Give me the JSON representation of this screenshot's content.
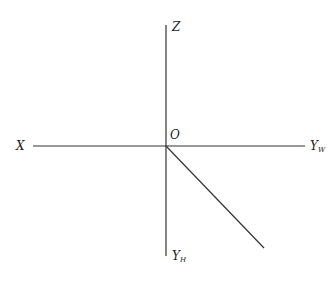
{
  "diagram": {
    "origin_label": "O",
    "axes": [
      {
        "id": "z",
        "label": "Z",
        "subscript": ""
      },
      {
        "id": "x",
        "label": "X",
        "subscript": ""
      },
      {
        "id": "yw",
        "label": "Y",
        "subscript": "W"
      },
      {
        "id": "yh",
        "label": "Y",
        "subscript": "H"
      }
    ],
    "line_color": "#333333"
  }
}
